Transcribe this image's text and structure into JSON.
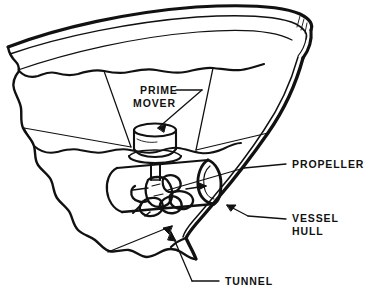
{
  "figure": {
    "ink_color": "#111111",
    "background_color": "#ffffff",
    "labels": {
      "prime_mover_line1": "PRIME",
      "prime_mover_line2": "MOVER",
      "propeller": "PROPELLER",
      "vessel_hull_line1": "VESSEL",
      "vessel_hull_line2": "HULL",
      "tunnel": "TUNNEL"
    },
    "parts": [
      "hull-rim",
      "hull-shell",
      "torn-edge",
      "waterline",
      "deck-line",
      "prime-mover",
      "drive-shaft",
      "gear-housing",
      "propeller",
      "tunnel"
    ]
  }
}
